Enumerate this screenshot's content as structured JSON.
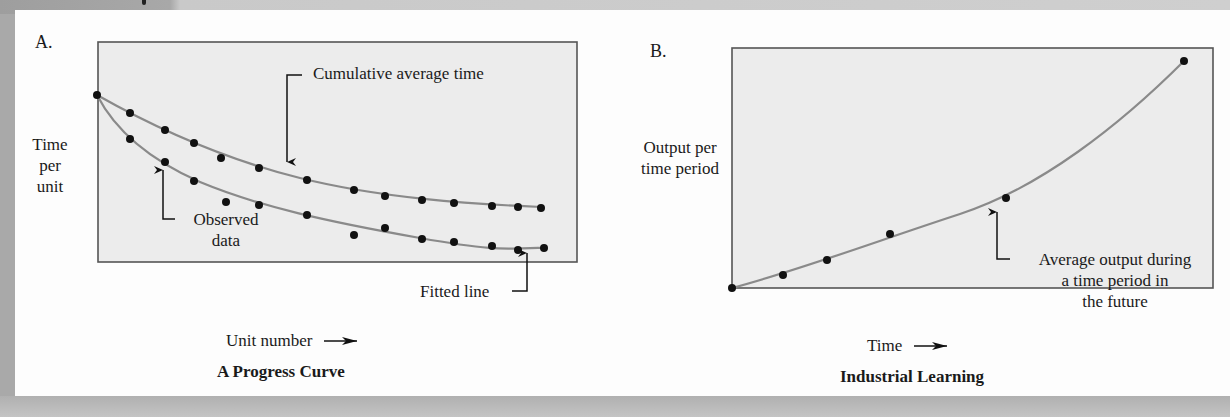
{
  "chart_data": [
    {
      "panel": "A.",
      "type": "scatter",
      "title": "A Progress Curve",
      "xlabel": "Unit number",
      "ylabel": "Time per unit",
      "grid": false,
      "legend": false,
      "annotations": [
        "Cumulative average time",
        "Observed data",
        "Fitted line"
      ],
      "x": [
        1,
        2,
        3,
        4,
        5,
        6,
        7,
        8,
        9,
        10,
        11,
        12,
        13,
        14
      ],
      "series": [
        {
          "name": "Cumulative average time",
          "values": [
            1.0,
            0.9,
            0.8,
            0.72,
            0.64,
            0.59,
            0.52,
            0.47,
            0.44,
            0.42,
            0.4,
            0.39,
            0.38,
            0.38
          ]
        },
        {
          "name": "Observed data",
          "values": [
            1.0,
            0.75,
            0.63,
            0.52,
            0.41,
            0.39,
            0.33,
            0.23,
            0.27,
            0.21,
            0.19,
            0.17,
            0.15,
            0.16
          ]
        },
        {
          "name": "Fitted line",
          "values": [
            1.0,
            0.76,
            0.62,
            0.52,
            0.45,
            0.39,
            0.33,
            0.28,
            0.25,
            0.22,
            0.2,
            0.18,
            0.17,
            0.16
          ]
        }
      ],
      "pixel_points": {
        "cumulative": [
          [
            97,
            95
          ],
          [
            130,
            113
          ],
          [
            165,
            130
          ],
          [
            194,
            143
          ],
          [
            221,
            158
          ],
          [
            259,
            168
          ],
          [
            307,
            180
          ],
          [
            354,
            190
          ],
          [
            385,
            196
          ],
          [
            422,
            200
          ],
          [
            454,
            203
          ],
          [
            492,
            206
          ],
          [
            518,
            207
          ],
          [
            541,
            208
          ]
        ],
        "observed": [
          [
            97,
            95
          ],
          [
            130,
            139
          ],
          [
            165,
            162
          ],
          [
            194,
            181
          ],
          [
            226,
            202
          ],
          [
            259,
            205
          ],
          [
            307,
            215
          ],
          [
            354,
            235
          ],
          [
            385,
            228
          ],
          [
            422,
            239
          ],
          [
            454,
            242
          ],
          [
            492,
            246
          ],
          [
            518,
            250
          ],
          [
            544,
            248
          ]
        ]
      },
      "fit_paths": {
        "cumulative": "M97,95 C150,125 220,158 300,178 S470,204 541,207",
        "observed": "M97,95 C115,130 150,160 200,182 C260,207 330,222 420,238 S510,247 544,248"
      }
    },
    {
      "panel": "B.",
      "type": "line",
      "title": "Industrial Learning",
      "xlabel": "Time",
      "ylabel": "Output per time period",
      "grid": false,
      "legend": false,
      "annotations": [
        "Average output during a time period in the future"
      ],
      "x": [
        0,
        0.11,
        0.19,
        0.33,
        0.57,
        0.94
      ],
      "values": [
        0,
        0.05,
        0.12,
        0.23,
        0.38,
        0.94
      ],
      "pixel_points": [
        [
          732,
          288
        ],
        [
          783,
          275
        ],
        [
          827,
          260
        ],
        [
          890,
          234
        ],
        [
          1006,
          198
        ],
        [
          1184,
          61
        ]
      ],
      "fit_path": "M732,288 C800,270 880,240 960,214 S1120,125 1184,61"
    }
  ],
  "panel_a": {
    "letter": "A.",
    "ylabel_lines": [
      "Time",
      "per",
      "unit"
    ],
    "xlabel": "Unit number",
    "caption": "A Progress Curve",
    "annotation_cumulative": "Cumulative average time",
    "annotation_observed_lines": [
      "Observed",
      "data"
    ],
    "annotation_fitted": "Fitted line"
  },
  "panel_b": {
    "letter": "B.",
    "ylabel_lines": [
      "Output per",
      "time period"
    ],
    "xlabel": "Time",
    "caption": "Industrial Learning",
    "annotation_lines": [
      "Average output during",
      "a time period in",
      "the future"
    ]
  },
  "colors": {
    "frame": "#555555",
    "plot_bg": "#ececec",
    "curve": "#8a8a8a",
    "point": "#111111",
    "text": "#1a1a1a"
  }
}
